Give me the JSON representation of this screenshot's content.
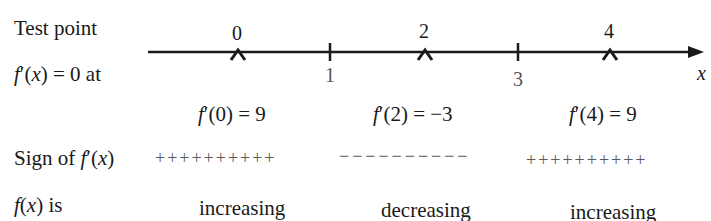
{
  "labels": {
    "test_point": "Test point",
    "fprime_zero_at": "f′(x) = 0 at",
    "sign_of": "Sign of f′(x)",
    "fx_is": "f(x) is"
  },
  "axis": {
    "variable": "x",
    "test_points": [
      "0",
      "2",
      "4"
    ],
    "critical_points": [
      "1",
      "3"
    ]
  },
  "derivative_values": [
    "f′(0) = 9",
    "f′(2) = −3",
    "f′(4) = 9"
  ],
  "signs": [
    "++++++++++",
    "−−−−−−−−−−",
    "++++++++++"
  ],
  "behavior": [
    "increasing",
    "decreasing",
    "increasing"
  ]
}
